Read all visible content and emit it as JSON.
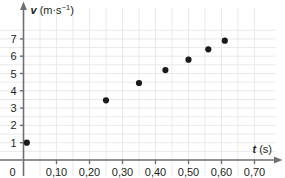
{
  "chart_data": {
    "type": "scatter",
    "title": "",
    "xlabel": "t (s)",
    "ylabel": "v (m·s⁻¹)",
    "xlabel_var": "t",
    "xlabel_unit": "(s)",
    "ylabel_var": "v",
    "ylabel_unit_base": "(m·s",
    "ylabel_unit_exp": "−1",
    "ylabel_unit_close": ")",
    "xlim": [
      0,
      0.72
    ],
    "ylim": [
      0,
      7.6
    ],
    "grid": true,
    "grid_x_step": 0.05,
    "grid_y_step": 0.5,
    "legend": "none",
    "decimal_separator": ",",
    "x_ticks": [
      0,
      0.1,
      0.2,
      0.3,
      0.4,
      0.5,
      0.6,
      0.7
    ],
    "x_tick_labels": [
      "0",
      "0,10",
      "0,20",
      "0,30",
      "0,40",
      "0,50",
      "0,60",
      "0,70"
    ],
    "y_ticks": [
      1,
      2,
      3,
      4,
      5,
      6,
      7
    ],
    "y_tick_labels": [
      "1",
      "2",
      "3",
      "4",
      "5",
      "6",
      "7"
    ],
    "x": [
      0.01,
      0.25,
      0.35,
      0.43,
      0.5,
      0.56,
      0.61
    ],
    "values": [
      1.0,
      3.45,
      4.45,
      5.2,
      5.8,
      6.4,
      6.9
    ],
    "points": [
      {
        "t": 0.01,
        "v": 1.0
      },
      {
        "t": 0.25,
        "v": 3.45
      },
      {
        "t": 0.35,
        "v": 4.45
      },
      {
        "t": 0.43,
        "v": 5.2
      },
      {
        "t": 0.5,
        "v": 5.8
      },
      {
        "t": 0.56,
        "v": 6.4
      },
      {
        "t": 0.61,
        "v": 6.9
      }
    ],
    "marker": "filled-circle",
    "marker_color": "#1a1a1a",
    "grid_color": "#e9e9ec",
    "axis_color": "#6f6f77",
    "text_color": "#231f20",
    "background": "#ffffff"
  }
}
